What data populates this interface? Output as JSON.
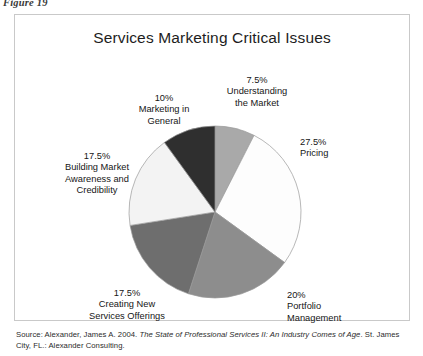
{
  "figure": {
    "label": "Figure 19"
  },
  "chart_frame": {
    "border_color": "#c9c9c9",
    "background": "#ffffff"
  },
  "source": {
    "prefix": "Source: Alexander, James A. 2004. ",
    "title_italic": "The State of Professional Services II: An Industry Comes of Age",
    "suffix": ". St. James City, FL.: Alexander Consulting."
  },
  "labels": {
    "understanding": {
      "pct": "7.5%",
      "line1": "Understanding",
      "line2": "the Market"
    },
    "pricing": {
      "pct": "27.5%",
      "line1": "Pricing"
    },
    "portfolio": {
      "pct": "20%",
      "line1": "Portfolio",
      "line2": "Management"
    },
    "creating": {
      "pct": "17.5%",
      "line1": "Creating New",
      "line2": "Services Offerings"
    },
    "building": {
      "pct": "17.5%",
      "line1": "Building Market",
      "line2": "Awareness and",
      "line3": "Credibility"
    },
    "general": {
      "pct": "10%",
      "line1": "Marketing in",
      "line2": "General"
    }
  },
  "chart_data": {
    "type": "pie",
    "title": "Services Marketing Critical Issues",
    "xlabel": "",
    "ylabel": "",
    "legend_position": "none",
    "grid": false,
    "units": "percent",
    "total": 100,
    "start_angle_deg": 0,
    "direction": "clockwise",
    "categories": [
      "Understanding the Market",
      "Pricing",
      "Portfolio Management",
      "Creating New Services Offerings",
      "Building Market Awareness and Credibility",
      "Marketing in General"
    ],
    "values": [
      7.5,
      27.5,
      20,
      17.5,
      17.5,
      10
    ],
    "value_labels": [
      "7.5%",
      "27.5%",
      "20%",
      "17.5%",
      "17.5%",
      "10%"
    ],
    "colors": [
      "#a9a9a9",
      "#fdfdfd",
      "#8d8d8d",
      "#6e6e6e",
      "#f3f3f3",
      "#2f2f2f"
    ],
    "slice_outline_color": "#9a9a9a",
    "center": {
      "x": 200,
      "y": 197
    },
    "radius": 86
  }
}
